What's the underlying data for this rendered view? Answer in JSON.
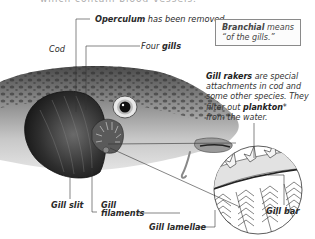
{
  "diagram": {
    "top_cutoff_text": "which contain blood vessels.",
    "labels": {
      "cod": "Cod",
      "operculum_bold": "Operculum",
      "operculum_rest": " has been removed.",
      "four": "Four ",
      "gills_bold": "gills",
      "gill_slit": "Gill slit",
      "gill_filaments_line1": "Gill",
      "gill_filaments_line2": "filaments",
      "gill_lamellae": "Gill lamellae",
      "gill_bar": "Gill bar"
    },
    "definition_box": {
      "term": "Branchial",
      "text_rest": " means",
      "line2": "“of the gills.”"
    },
    "gill_rakers_note": {
      "term": "Gill rakers",
      "line1_rest": " are special",
      "line2": "attachments in cod and",
      "line3": "some other species. They",
      "line4_pre": "filter out ",
      "line4_bold": "plankton",
      "line4_post": "*",
      "line5": "from the water."
    },
    "colors": {
      "text": "#2a2a2a",
      "leader_lines": "#333333",
      "box_border": "#8a8a8a",
      "fish_light": "#d6d6d6",
      "fish_dark": "#3a3a3a"
    }
  }
}
